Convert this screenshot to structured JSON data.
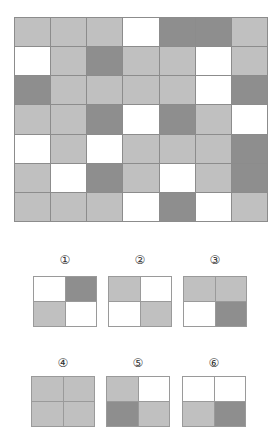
{
  "puzzle": {
    "grid_rows": 7,
    "grid_cols": 7,
    "legend": {
      "L": "light gray",
      "D": "dark gray",
      "W": "white"
    },
    "colors": {
      "L": "#c0c0c0",
      "D": "#8e8e8e",
      "W": "#ffffff"
    },
    "grid": [
      [
        "L",
        "L",
        "L",
        "W",
        "D",
        "D",
        "L"
      ],
      [
        "W",
        "L",
        "D",
        "L",
        "L",
        "W",
        "L"
      ],
      [
        "D",
        "L",
        "L",
        "L",
        "L",
        "W",
        "D"
      ],
      [
        "L",
        "L",
        "D",
        "W",
        "D",
        "L",
        "W"
      ],
      [
        "W",
        "L",
        "W",
        "L",
        "L",
        "L",
        "D"
      ],
      [
        "L",
        "W",
        "D",
        "L",
        "W",
        "L",
        "D"
      ],
      [
        "L",
        "L",
        "L",
        "W",
        "D",
        "W",
        "L"
      ]
    ]
  },
  "options": [
    {
      "label": "①",
      "cells": [
        "W",
        "D",
        "L",
        "W"
      ]
    },
    {
      "label": "②",
      "cells": [
        "L",
        "W",
        "W",
        "L"
      ]
    },
    {
      "label": "③",
      "cells": [
        "L",
        "L",
        "W",
        "D"
      ]
    },
    {
      "label": "④",
      "cells": [
        "L",
        "L",
        "L",
        "L"
      ]
    },
    {
      "label": "⑤",
      "cells": [
        "L",
        "W",
        "D",
        "L"
      ]
    },
    {
      "label": "⑥",
      "cells": [
        "W",
        "W",
        "L",
        "D"
      ]
    }
  ]
}
